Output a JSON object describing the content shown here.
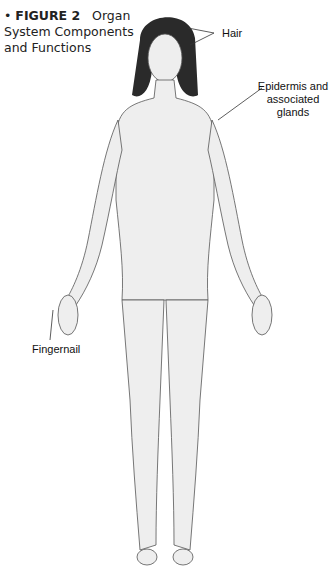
{
  "figure": {
    "bullet": "•",
    "number": "FIGURE 2",
    "title_part1": "Organ",
    "title_part2": "System Components",
    "title_part3": "and Functions"
  },
  "labels": {
    "hair": "Hair",
    "epidermis_line1": "Epidermis and",
    "epidermis_line2": "associated",
    "epidermis_line3": "glands",
    "fingernail": "Fingernail"
  },
  "colors": {
    "background": "#ffffff",
    "outline": "#555555",
    "skin": "#eeeeee",
    "hair": "#2a2a2a",
    "text": "#111111"
  }
}
